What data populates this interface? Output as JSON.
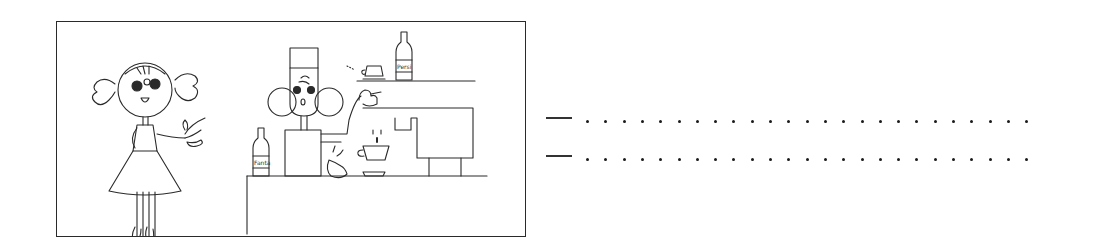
{
  "illustration": {
    "description": "Cartoon cafe scene: a girl with pigtails pointing, and a barista making coffee at an espresso machine behind a counter",
    "bottle_label_shelf": "Persi",
    "bottle_label_counter": "Fanta",
    "stroke_color": "#2a2a2a",
    "background_color": "#ffffff"
  },
  "answer_lines": [
    {
      "marker": "—",
      "dot_count": 25,
      "value": ""
    },
    {
      "marker": "—",
      "dot_count": 25,
      "value": ""
    }
  ]
}
